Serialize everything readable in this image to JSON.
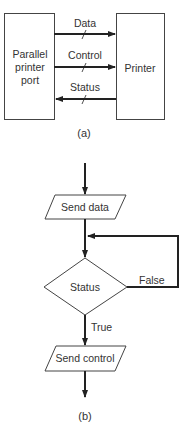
{
  "figure_a": {
    "left_box": {
      "lines": [
        "Parallel",
        "printer",
        "port"
      ]
    },
    "right_box": {
      "label": "Printer"
    },
    "signals": [
      {
        "label": "Data",
        "direction": "to-printer"
      },
      {
        "label": "Control",
        "direction": "to-printer"
      },
      {
        "label": "Status",
        "direction": "to-port"
      }
    ],
    "caption": "(a)"
  },
  "figure_b": {
    "steps": [
      {
        "type": "io",
        "label": "Send data"
      },
      {
        "type": "decision",
        "label": "Status"
      },
      {
        "type": "io",
        "label": "Send control"
      }
    ],
    "branches": {
      "false_label": "False",
      "true_label": "True"
    },
    "caption": "(b)"
  },
  "colors": {
    "stroke": "#222222",
    "text": "#333333",
    "background": "#ffffff"
  }
}
